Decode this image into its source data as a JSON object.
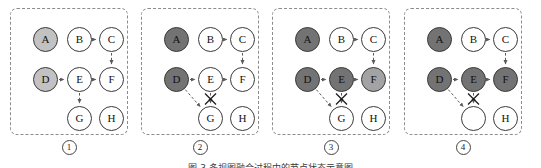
{
  "figure": {
    "panel_count": 4,
    "caption_clipped": "图 3  多视图融合过程中的节点状态示意图",
    "node_labels": [
      "A",
      "B",
      "C",
      "D",
      "E",
      "F",
      "G",
      "H"
    ],
    "shades": {
      "white": "#ffffff",
      "light_gray": "#c2c2c2",
      "mid_gray": "#a3a3a3",
      "dark_gray": "#737373",
      "outline": "#3a3a3a",
      "panel_border": "#8c8c8c",
      "edge": "#5a5a5a"
    }
  },
  "panels": [
    {
      "index_label": "1",
      "nodes": [
        {
          "id": "A",
          "label": "A",
          "shade": "light"
        },
        {
          "id": "B",
          "label": "B",
          "shade": "white"
        },
        {
          "id": "C",
          "label": "C",
          "shade": "white"
        },
        {
          "id": "D",
          "label": "D",
          "shade": "light"
        },
        {
          "id": "E",
          "label": "E",
          "shade": "white"
        },
        {
          "id": "F",
          "label": "F",
          "shade": "white"
        },
        {
          "id": "G",
          "label": "G",
          "shade": "white"
        },
        {
          "id": "H",
          "label": "H",
          "shade": "white"
        }
      ],
      "edges": [
        "B->C",
        "C->F",
        "D->E",
        "E->F",
        "E->G"
      ],
      "crossed_edges": [],
      "added_edges": []
    },
    {
      "index_label": "2",
      "nodes": [
        {
          "id": "A",
          "label": "A",
          "shade": "dark"
        },
        {
          "id": "B",
          "label": "B",
          "shade": "white"
        },
        {
          "id": "C",
          "label": "C",
          "shade": "white"
        },
        {
          "id": "D",
          "label": "D",
          "shade": "dark"
        },
        {
          "id": "E",
          "label": "E",
          "shade": "white"
        },
        {
          "id": "F",
          "label": "F",
          "shade": "white"
        },
        {
          "id": "G",
          "label": "G",
          "shade": "white"
        },
        {
          "id": "H",
          "label": "H",
          "shade": "white"
        }
      ],
      "edges": [
        "B->C",
        "C->F",
        "D->E",
        "E->F",
        "E->G"
      ],
      "crossed_edges": [
        "E->G"
      ],
      "added_edges": [
        "D->G"
      ]
    },
    {
      "index_label": "3",
      "nodes": [
        {
          "id": "A",
          "label": "A",
          "shade": "dark"
        },
        {
          "id": "B",
          "label": "B",
          "shade": "white"
        },
        {
          "id": "C",
          "label": "C",
          "shade": "white"
        },
        {
          "id": "D",
          "label": "D",
          "shade": "dark"
        },
        {
          "id": "E",
          "label": "E",
          "shade": "dark"
        },
        {
          "id": "F",
          "label": "F",
          "shade": "mid"
        },
        {
          "id": "G",
          "label": "G",
          "shade": "white"
        },
        {
          "id": "H",
          "label": "H",
          "shade": "white"
        }
      ],
      "edges": [
        "B->C",
        "C->F",
        "D->E",
        "E->F",
        "E->G"
      ],
      "crossed_edges": [
        "E->G"
      ],
      "added_edges": [
        "D->G"
      ]
    },
    {
      "index_label": "4",
      "nodes": [
        {
          "id": "A",
          "label": "A",
          "shade": "dark"
        },
        {
          "id": "B",
          "label": "B",
          "shade": "white"
        },
        {
          "id": "C",
          "label": "C",
          "shade": "white"
        },
        {
          "id": "D",
          "label": "D",
          "shade": "dark"
        },
        {
          "id": "E",
          "label": "E",
          "shade": "dark"
        },
        {
          "id": "F",
          "label": "F",
          "shade": "dark"
        },
        {
          "id": "G",
          "label": "",
          "shade": "white"
        },
        {
          "id": "H",
          "label": "H",
          "shade": "white"
        }
      ],
      "edges": [
        "B->C",
        "C->F",
        "D->E",
        "E->F",
        "E->G"
      ],
      "crossed_edges": [
        "E->G"
      ],
      "added_edges": [
        "D->G"
      ]
    }
  ]
}
